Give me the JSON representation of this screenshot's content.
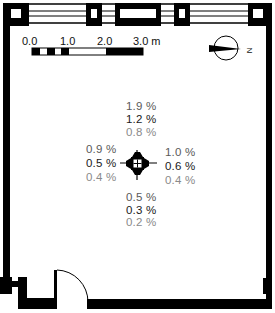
{
  "scale_bar": {
    "labels": [
      "0.0",
      "1.0",
      "2.0",
      "3.0 m"
    ]
  },
  "north_arrow": {
    "label": "N"
  },
  "colors": {
    "wall": "#000000",
    "row1": "#5a5a5a",
    "row2": "#1a1a1a",
    "row3": "#8a8a8a"
  },
  "measurements": {
    "top": [
      "1.9 %",
      "1.2 %",
      "0.8 %"
    ],
    "left": [
      "0.9 %",
      "0.5 %",
      "0.4 %"
    ],
    "right": [
      "1.0 %",
      "0.6 %",
      "0.4 %"
    ],
    "bottom": [
      "0.5 %",
      "0.3 %",
      "0.2 %"
    ]
  }
}
